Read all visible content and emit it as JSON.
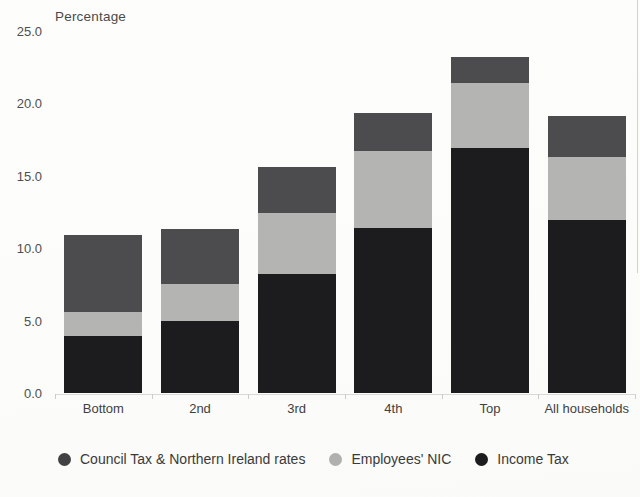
{
  "chart_data": {
    "type": "bar",
    "stacked": true,
    "title": "Percentage",
    "categories": [
      "Bottom",
      "2nd",
      "3rd",
      "4th",
      "Top",
      "All households"
    ],
    "series": [
      {
        "name": "Income Tax",
        "color": "#1c1c1e",
        "values": [
          3.9,
          5.0,
          8.2,
          11.4,
          16.9,
          11.9
        ]
      },
      {
        "name": "Employees' NIC",
        "color": "#b4b4b2",
        "values": [
          1.7,
          2.5,
          4.2,
          5.3,
          4.5,
          4.4
        ]
      },
      {
        "name": "Council Tax & Northern Ireland rates",
        "color": "#4c4c4e",
        "values": [
          5.3,
          3.8,
          3.2,
          2.6,
          1.8,
          2.8
        ]
      }
    ],
    "totals": [
      10.9,
      11.3,
      15.6,
      19.3,
      23.2,
      19.1
    ],
    "ylim": [
      0,
      25
    ],
    "ytick_values": [
      0,
      5,
      10,
      15,
      20,
      25
    ],
    "ytick_labels": [
      "0.0",
      "5.0",
      "10.0",
      "15.0",
      "20.0",
      "25.0"
    ],
    "xlabel": "",
    "ylabel": "Percentage",
    "grid": false,
    "legend_position": "bottom",
    "legend": [
      {
        "label": "Council Tax & Northern Ireland rates",
        "color": "#414143"
      },
      {
        "label": "Employees' NIC",
        "color": "#b0b0ae"
      },
      {
        "label": "Income Tax",
        "color": "#1c1c1e"
      }
    ]
  }
}
